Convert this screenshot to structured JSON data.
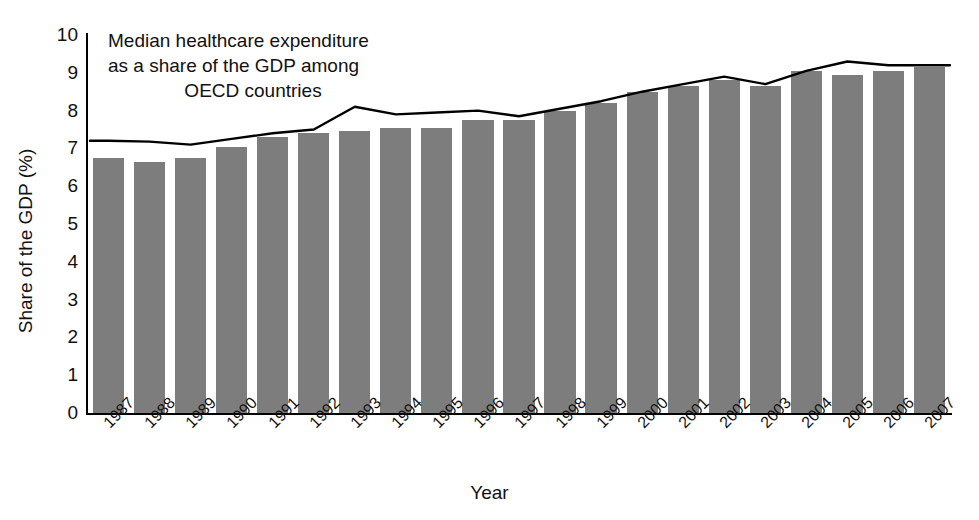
{
  "chart_data": {
    "type": "bar",
    "title": "",
    "annotation": {
      "line1": "Median healthcare expenditure",
      "line2": "as a share of the GDP among",
      "line3": "OECD countries"
    },
    "xlabel": "Year",
    "ylabel": "Share of the GDP (%)",
    "ylim": [
      0,
      10
    ],
    "yticks": [
      "0",
      "1",
      "2",
      "3",
      "4",
      "5",
      "6",
      "7",
      "8",
      "9",
      "10"
    ],
    "grid": false,
    "legend": "none",
    "bar_color": "#7d7d7d",
    "line_color": "#000000",
    "categories": [
      "1987",
      "1988",
      "1989",
      "1990",
      "1991",
      "1992",
      "1993",
      "1994",
      "1995",
      "1996",
      "1997",
      "1998",
      "1999",
      "2000",
      "2001",
      "2002",
      "2003",
      "2004",
      "2005",
      "2006",
      "2007"
    ],
    "series": [
      {
        "name": "Median healthcare expenditure as a share of the GDP among OECD countries",
        "kind": "bar",
        "values": [
          6.75,
          6.65,
          6.75,
          7.05,
          7.3,
          7.4,
          7.45,
          7.55,
          7.55,
          7.75,
          7.75,
          8.0,
          8.2,
          8.5,
          8.65,
          8.8,
          8.65,
          9.05,
          8.95,
          9.05,
          9.15
        ]
      },
      {
        "name": "Trend line",
        "kind": "line",
        "values": [
          7.2,
          7.18,
          7.1,
          7.25,
          7.4,
          7.5,
          8.1,
          7.9,
          7.95,
          8.0,
          7.85,
          8.05,
          8.25,
          8.5,
          8.7,
          8.9,
          8.7,
          9.05,
          9.3,
          9.2,
          9.2
        ]
      }
    ]
  }
}
